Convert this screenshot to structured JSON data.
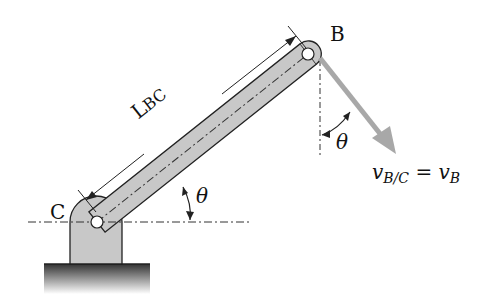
{
  "diagram": {
    "type": "rotating link about fixed pin",
    "labels": {
      "point_b": "B",
      "point_c": "C",
      "length": {
        "main": "L",
        "sub": "BC"
      },
      "theta_link": "θ",
      "theta_velocity": "θ",
      "velocity": {
        "lhs_main": "v",
        "lhs_sub": "B/C",
        "eq": "=",
        "rhs_main": "v",
        "rhs_sub": "B"
      }
    },
    "colors": {
      "link_fill": "#c8c8c8",
      "outline": "#222222",
      "velocity_arrow": "#a8a8a8",
      "ground": "#555555"
    }
  }
}
